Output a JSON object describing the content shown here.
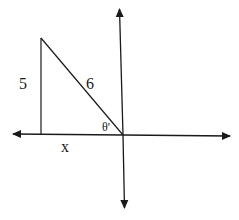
{
  "diagram": {
    "type": "reference-angle-triangle",
    "quadrant": "II",
    "labels": {
      "vertical_side": "5",
      "hypotenuse": "6",
      "angle": "θ'",
      "horizontal_side": "x"
    },
    "geometry": {
      "origin": [
        123,
        135
      ],
      "triangle_vertices": [
        [
          41,
          38
        ],
        [
          41,
          135
        ],
        [
          123,
          135
        ]
      ],
      "x_axis": {
        "from": [
          14,
          135
        ],
        "to": [
          230,
          136
        ]
      },
      "y_axis": {
        "from": [
          120,
          10
        ],
        "to": [
          124,
          207
        ]
      }
    },
    "colors": {
      "stroke": "#1a1a1a",
      "background": "#ffffff"
    }
  }
}
